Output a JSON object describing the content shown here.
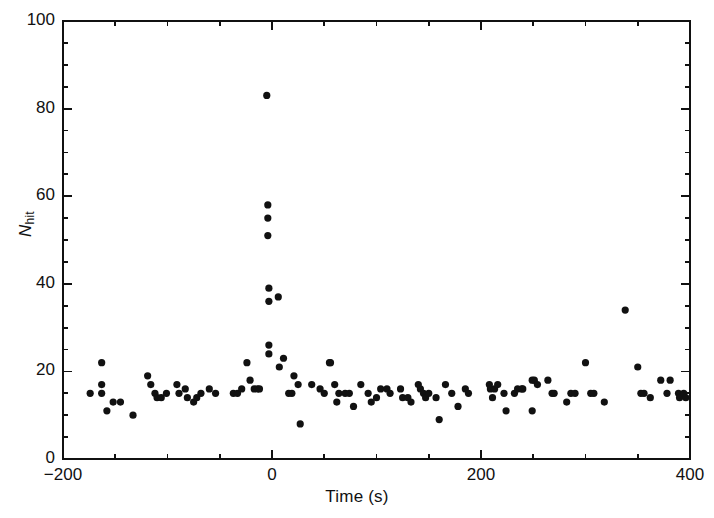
{
  "chart_data": {
    "type": "scatter",
    "title": "",
    "xlabel": "Time (s)",
    "ylabel": "N_hit",
    "ylabel_parts": {
      "variable": "N",
      "subscript": "hit"
    },
    "xlim": [
      -200,
      400
    ],
    "ylim": [
      0,
      100
    ],
    "xticks": [
      -200,
      0,
      200,
      400
    ],
    "xtick_labels": [
      "−200",
      "0",
      "200",
      "400"
    ],
    "yticks": [
      0,
      20,
      40,
      60,
      80,
      100
    ],
    "ytick_labels": [
      "0",
      "20",
      "40",
      "60",
      "80",
      "100"
    ],
    "x_minor_tick_step": 50,
    "y_minor_tick_step": 5,
    "grid": false,
    "legend": null,
    "marker": {
      "shape": "circle",
      "size_px": 6,
      "color": "#111111"
    },
    "frame_color": "#111111",
    "background": "#ffffff",
    "points": [
      [
        -174,
        15
      ],
      [
        -163,
        22
      ],
      [
        -163,
        17
      ],
      [
        -163,
        15
      ],
      [
        -158,
        11
      ],
      [
        -152,
        13
      ],
      [
        -145,
        13
      ],
      [
        -133,
        10
      ],
      [
        -119,
        19
      ],
      [
        -116,
        17
      ],
      [
        -112,
        15
      ],
      [
        -110,
        14
      ],
      [
        -106,
        14
      ],
      [
        -101,
        15
      ],
      [
        -91,
        17
      ],
      [
        -89,
        15
      ],
      [
        -83,
        16
      ],
      [
        -81,
        14
      ],
      [
        -75,
        13
      ],
      [
        -72,
        14
      ],
      [
        -68,
        15
      ],
      [
        -60,
        16
      ],
      [
        -54,
        15
      ],
      [
        -37,
        15
      ],
      [
        -33,
        15
      ],
      [
        -29,
        16
      ],
      [
        -24,
        22
      ],
      [
        -21,
        18
      ],
      [
        -17,
        16
      ],
      [
        -14,
        16
      ],
      [
        -12,
        16
      ],
      [
        -5,
        83
      ],
      [
        -4,
        58
      ],
      [
        -4,
        55
      ],
      [
        -4,
        51
      ],
      [
        -3,
        39
      ],
      [
        -3,
        36
      ],
      [
        6,
        37
      ],
      [
        -3,
        26
      ],
      [
        -3,
        24
      ],
      [
        11,
        23
      ],
      [
        7,
        21
      ],
      [
        21,
        19
      ],
      [
        25,
        17
      ],
      [
        19,
        15
      ],
      [
        16,
        15
      ],
      [
        27,
        8
      ],
      [
        38,
        17
      ],
      [
        46,
        16
      ],
      [
        50,
        15
      ],
      [
        55,
        22
      ],
      [
        56,
        22
      ],
      [
        60,
        17
      ],
      [
        62,
        13
      ],
      [
        64,
        15
      ],
      [
        70,
        15
      ],
      [
        74,
        15
      ],
      [
        78,
        12
      ],
      [
        85,
        17
      ],
      [
        92,
        15
      ],
      [
        95,
        13
      ],
      [
        100,
        14
      ],
      [
        104,
        16
      ],
      [
        110,
        16
      ],
      [
        113,
        15
      ],
      [
        123,
        16
      ],
      [
        125,
        14
      ],
      [
        130,
        14
      ],
      [
        133,
        13
      ],
      [
        140,
        17
      ],
      [
        142,
        16
      ],
      [
        145,
        15
      ],
      [
        147,
        14
      ],
      [
        150,
        15
      ],
      [
        157,
        14
      ],
      [
        160,
        9
      ],
      [
        166,
        17
      ],
      [
        172,
        15
      ],
      [
        178,
        12
      ],
      [
        185,
        16
      ],
      [
        188,
        15
      ],
      [
        208,
        17
      ],
      [
        209,
        16
      ],
      [
        213,
        16
      ],
      [
        216,
        17
      ],
      [
        222,
        15
      ],
      [
        211,
        14
      ],
      [
        249,
        18
      ],
      [
        240,
        16
      ],
      [
        232,
        15
      ],
      [
        235,
        16
      ],
      [
        239,
        16
      ],
      [
        251,
        18
      ],
      [
        254,
        17
      ],
      [
        264,
        18
      ],
      [
        268,
        15
      ],
      [
        270,
        15
      ],
      [
        224,
        11
      ],
      [
        249,
        11
      ],
      [
        286,
        15
      ],
      [
        290,
        15
      ],
      [
        282,
        13
      ],
      [
        300,
        22
      ],
      [
        305,
        15
      ],
      [
        308,
        15
      ],
      [
        318,
        13
      ],
      [
        338,
        34
      ],
      [
        350,
        21
      ],
      [
        353,
        15
      ],
      [
        356,
        15
      ],
      [
        362,
        14
      ],
      [
        372,
        18
      ],
      [
        381,
        18
      ],
      [
        378,
        15
      ],
      [
        389,
        15
      ],
      [
        390,
        14
      ],
      [
        394,
        15
      ],
      [
        396,
        14
      ]
    ]
  },
  "figure": {
    "plot_area": {
      "left": 63,
      "top": 21,
      "right": 690,
      "bottom": 459
    }
  }
}
